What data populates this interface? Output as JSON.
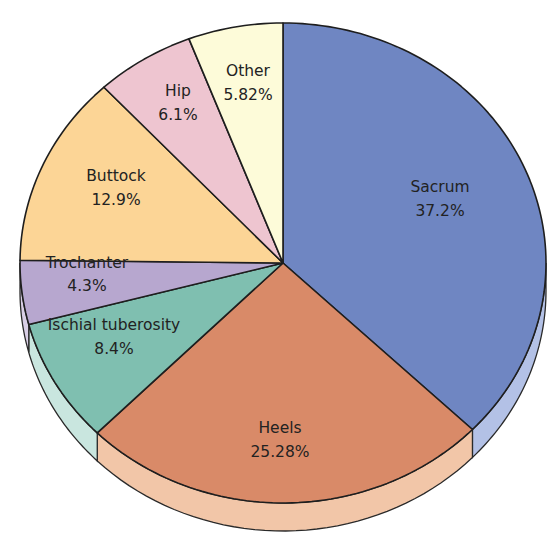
{
  "chart_data": {
    "type": "pie",
    "style": "3d-tilted",
    "title": "",
    "start_angle_deg": 0,
    "direction": "clockwise-from-12-oclock",
    "slices": [
      {
        "label": "Sacrum",
        "value": 37.2,
        "value_label": "37.2%",
        "color": "#6f86c2",
        "side_color": "#b3c1e6"
      },
      {
        "label": "Heels",
        "value": 25.28,
        "value_label": "25.28%",
        "color": "#d98a68",
        "side_color": "#f2c6a8"
      },
      {
        "label": "Ischial tuberosity",
        "value": 8.4,
        "value_label": "8.4%",
        "color": "#7fbfb0",
        "side_color": "#c9e6df"
      },
      {
        "label": "Trochanter",
        "value": 4.3,
        "value_label": "4.3%",
        "color": "#b7a7cf",
        "side_color": "#d9cfe6"
      },
      {
        "label": "Buttock",
        "value": 12.9,
        "value_label": "12.9%",
        "color": "#fcd596",
        "side_color": "#fde8c4"
      },
      {
        "label": "Hip",
        "value": 6.1,
        "value_label": "6.1%",
        "color": "#eec5d0",
        "side_color": "#f6e0e6"
      },
      {
        "label": "Other",
        "value": 5.82,
        "value_label": "5.82%",
        "color": "#fdfbd9",
        "side_color": "#fefde9"
      }
    ]
  },
  "labels": {
    "sacrum": {
      "name": "Sacrum",
      "pct": "37.2%"
    },
    "heels": {
      "name": "Heels",
      "pct": "25.28%"
    },
    "ischial": {
      "name": "Ischial tuberosity",
      "pct": "8.4%"
    },
    "trochanter": {
      "name": "Trochanter",
      "pct": "4.3%"
    },
    "buttock": {
      "name": "Buttock",
      "pct": "12.9%"
    },
    "hip": {
      "name": "Hip",
      "pct": "6.1%"
    },
    "other": {
      "name": "Other",
      "pct": "5.82%"
    }
  }
}
